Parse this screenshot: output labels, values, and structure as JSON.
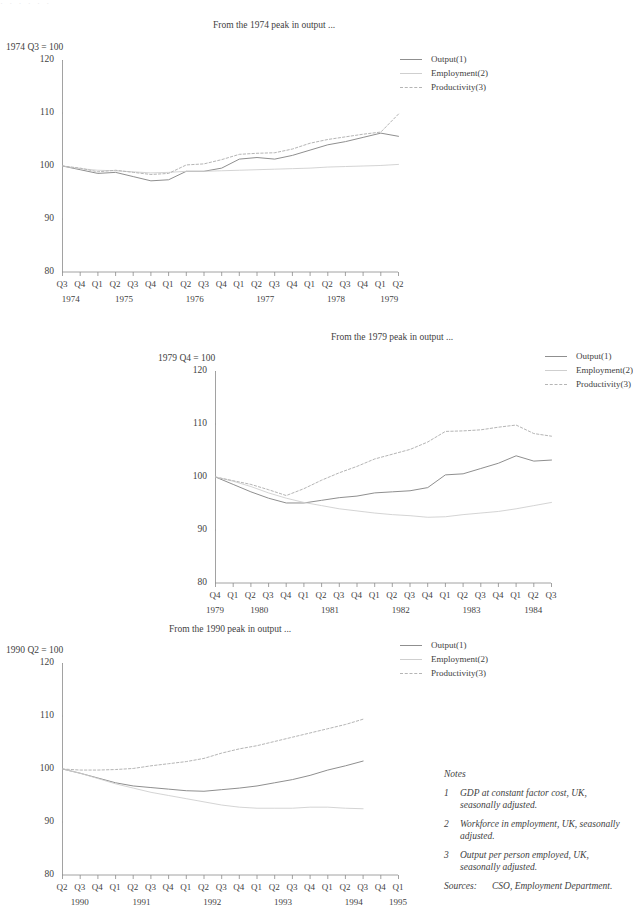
{
  "page": {
    "clipped_top_text": "· · ·  ·  ·      ·"
  },
  "notes": {
    "heading": "Notes",
    "items": [
      {
        "num": "1",
        "text": "GDP at constant factor cost, UK, seasonally adjusted."
      },
      {
        "num": "2",
        "text": "Workforce in employment, UK, seasonally adjusted."
      },
      {
        "num": "3",
        "text": "Output per person employed, UK, seasonally adjusted."
      }
    ],
    "sources_label": "Sources:",
    "sources_text": "CSO, Employment Department."
  },
  "legend_series": [
    {
      "name": "Output(1)",
      "style": "solid",
      "color": "#8f8f8f"
    },
    {
      "name": "Employment(2)",
      "style": "solid-light",
      "color": "#cfcfcf"
    },
    {
      "name": "Productivity(3)",
      "style": "dashed",
      "color": "#b5b5b5"
    }
  ],
  "chart_data": [
    {
      "id": "chart-1974",
      "type": "line",
      "title": "From the 1974 peak in output ...",
      "ylabel": "1974 Q3 = 100",
      "xlabel": "",
      "ylim": [
        80,
        120
      ],
      "yticks": [
        80,
        90,
        100,
        110,
        120
      ],
      "grid": false,
      "legend_position": "top-right",
      "x": [
        "1974 Q3",
        "1974 Q4",
        "1975 Q1",
        "1975 Q2",
        "1975 Q3",
        "1975 Q4",
        "1976 Q1",
        "1976 Q2",
        "1976 Q3",
        "1976 Q4",
        "1977 Q1",
        "1977 Q2",
        "1977 Q3",
        "1977 Q4",
        "1978 Q1",
        "1978 Q2",
        "1978 Q3",
        "1978 Q4",
        "1979 Q1",
        "1979 Q2"
      ],
      "quarter_ticks": [
        "Q3",
        "Q4",
        "Q1",
        "Q2",
        "Q3",
        "Q4",
        "Q1",
        "Q2",
        "Q3",
        "Q4",
        "Q1",
        "Q2",
        "Q3",
        "Q4",
        "Q1",
        "Q2",
        "Q3",
        "Q4",
        "Q1",
        "Q2"
      ],
      "year_ticks": [
        {
          "label": "1974",
          "start_index": 0,
          "end_index": 1
        },
        {
          "label": "1975",
          "start_index": 2,
          "end_index": 5
        },
        {
          "label": "1976",
          "start_index": 6,
          "end_index": 9
        },
        {
          "label": "1977",
          "start_index": 10,
          "end_index": 13
        },
        {
          "label": "1978",
          "start_index": 14,
          "end_index": 17
        },
        {
          "label": "1979",
          "start_index": 18,
          "end_index": 19
        }
      ],
      "series": [
        {
          "name": "Output(1)",
          "style": "solid",
          "color": "#8f8f8f",
          "values": [
            100.0,
            99.3,
            98.6,
            98.8,
            98.0,
            97.2,
            97.4,
            99.0,
            99.0,
            99.6,
            101.3,
            101.6,
            101.3,
            102.0,
            103.0,
            104.0,
            104.6,
            105.4,
            106.2,
            105.6
          ]
        },
        {
          "name": "Employment(2)",
          "style": "solid-light",
          "color": "#cfcfcf",
          "values": [
            100.0,
            99.5,
            99.2,
            99.1,
            98.9,
            98.7,
            98.8,
            99.0,
            99.0,
            99.1,
            99.2,
            99.3,
            99.4,
            99.5,
            99.6,
            99.8,
            99.9,
            100.0,
            100.1,
            100.3
          ]
        },
        {
          "name": "Productivity(3)",
          "style": "dashed",
          "color": "#b5b5b5",
          "values": [
            100.0,
            99.6,
            98.9,
            99.2,
            98.8,
            98.4,
            98.6,
            100.2,
            100.4,
            101.2,
            102.2,
            102.4,
            102.5,
            103.2,
            104.3,
            105.0,
            105.5,
            106.0,
            106.4,
            109.8
          ]
        }
      ]
    },
    {
      "id": "chart-1979",
      "type": "line",
      "title": "From the 1979 peak in output ...",
      "ylabel": "1979 Q4 = 100",
      "xlabel": "",
      "ylim": [
        80,
        120
      ],
      "yticks": [
        80,
        90,
        100,
        110,
        120
      ],
      "grid": false,
      "legend_position": "top-right",
      "x": [
        "1979 Q4",
        "1980 Q1",
        "1980 Q2",
        "1980 Q3",
        "1980 Q4",
        "1981 Q1",
        "1981 Q2",
        "1981 Q3",
        "1981 Q4",
        "1982 Q1",
        "1982 Q2",
        "1982 Q3",
        "1982 Q4",
        "1983 Q1",
        "1983 Q2",
        "1983 Q3",
        "1983 Q4",
        "1984 Q1",
        "1984 Q2",
        "1984 Q3"
      ],
      "quarter_ticks": [
        "Q4",
        "Q1",
        "Q2",
        "Q3",
        "Q4",
        "Q1",
        "Q2",
        "Q3",
        "Q4",
        "Q1",
        "Q2",
        "Q3",
        "Q4",
        "Q1",
        "Q2",
        "Q3",
        "Q4",
        "Q1",
        "Q2",
        "Q3"
      ],
      "year_ticks": [
        {
          "label": "1979",
          "start_index": 0,
          "end_index": 0
        },
        {
          "label": "1980",
          "start_index": 1,
          "end_index": 4
        },
        {
          "label": "1981",
          "start_index": 5,
          "end_index": 8
        },
        {
          "label": "1982",
          "start_index": 9,
          "end_index": 12
        },
        {
          "label": "1983",
          "start_index": 13,
          "end_index": 16
        },
        {
          "label": "1984",
          "start_index": 17,
          "end_index": 19
        }
      ],
      "series": [
        {
          "name": "Output(1)",
          "style": "solid",
          "color": "#8f8f8f",
          "values": [
            100.0,
            98.6,
            97.2,
            96.0,
            95.1,
            95.1,
            95.6,
            96.1,
            96.4,
            97.0,
            97.2,
            97.4,
            98.0,
            100.4,
            100.6,
            101.6,
            102.6,
            104.0,
            103.0,
            103.2
          ]
        },
        {
          "name": "Employment(2)",
          "style": "solid-light",
          "color": "#cfcfcf",
          "values": [
            100.0,
            99.2,
            98.2,
            97.0,
            96.0,
            95.2,
            94.6,
            94.0,
            93.6,
            93.2,
            92.9,
            92.7,
            92.4,
            92.5,
            92.9,
            93.2,
            93.5,
            94.0,
            94.6,
            95.2
          ]
        },
        {
          "name": "Productivity(3)",
          "style": "dashed",
          "color": "#b5b5b5",
          "values": [
            100.0,
            99.3,
            98.6,
            97.6,
            96.5,
            97.8,
            99.4,
            100.8,
            102.0,
            103.4,
            104.3,
            105.2,
            106.6,
            108.6,
            108.7,
            108.9,
            109.4,
            109.8,
            108.2,
            107.7
          ]
        }
      ]
    },
    {
      "id": "chart-1990",
      "type": "line",
      "title": "From the 1990 peak in output ...",
      "ylabel": "1990 Q2 = 100",
      "xlabel": "",
      "ylim": [
        80,
        120
      ],
      "yticks": [
        80,
        90,
        100,
        110,
        120
      ],
      "grid": false,
      "legend_position": "top-right",
      "x": [
        "1990 Q2",
        "1990 Q3",
        "1990 Q4",
        "1991 Q1",
        "1991 Q2",
        "1991 Q3",
        "1991 Q4",
        "1992 Q1",
        "1992 Q2",
        "1992 Q3",
        "1992 Q4",
        "1993 Q1",
        "1993 Q2",
        "1993 Q3",
        "1993 Q4",
        "1994 Q1",
        "1994 Q2",
        "1994 Q3",
        "1994 Q4",
        "1995 Q1"
      ],
      "quarter_ticks": [
        "Q2",
        "Q3",
        "Q4",
        "Q1",
        "Q2",
        "Q3",
        "Q4",
        "Q1",
        "Q2",
        "Q3",
        "Q4",
        "Q1",
        "Q2",
        "Q3",
        "Q4",
        "Q1",
        "Q2",
        "Q3",
        "Q4",
        "Q1"
      ],
      "year_ticks": [
        {
          "label": "1990",
          "start_index": 0,
          "end_index": 2
        },
        {
          "label": "1991",
          "start_index": 3,
          "end_index": 6
        },
        {
          "label": "1992",
          "start_index": 7,
          "end_index": 10
        },
        {
          "label": "1993",
          "start_index": 11,
          "end_index": 14
        },
        {
          "label": "1994",
          "start_index": 15,
          "end_index": 18
        },
        {
          "label": "1995",
          "start_index": 19,
          "end_index": 19
        }
      ],
      "series": [
        {
          "name": "Output(1)",
          "style": "solid",
          "color": "#8f8f8f",
          "values": [
            100.0,
            99.2,
            98.3,
            97.4,
            96.8,
            96.5,
            96.2,
            95.9,
            95.8,
            96.1,
            96.4,
            96.8,
            97.4,
            98.0,
            98.8,
            99.8,
            100.6,
            101.5,
            null,
            null
          ]
        },
        {
          "name": "Employment(2)",
          "style": "solid-light",
          "color": "#cfcfcf",
          "values": [
            100.0,
            99.2,
            98.2,
            97.2,
            96.4,
            95.6,
            95.0,
            94.4,
            93.8,
            93.2,
            92.8,
            92.6,
            92.6,
            92.6,
            92.8,
            92.8,
            92.6,
            92.5,
            null,
            null
          ]
        },
        {
          "name": "Productivity(3)",
          "style": "dashed",
          "color": "#b5b5b5",
          "values": [
            100.0,
            99.8,
            99.8,
            99.9,
            100.1,
            100.6,
            101.0,
            101.4,
            102.0,
            103.0,
            103.8,
            104.4,
            105.2,
            106.0,
            106.8,
            107.6,
            108.4,
            109.4,
            null,
            null
          ]
        }
      ]
    }
  ]
}
